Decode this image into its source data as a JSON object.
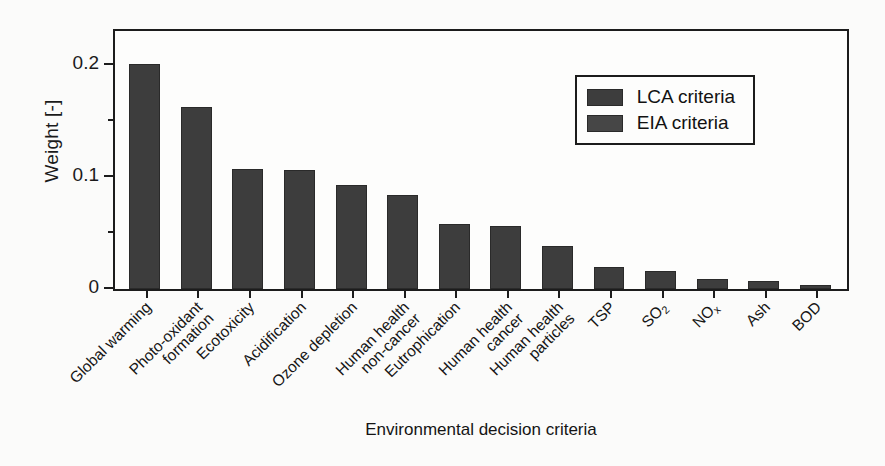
{
  "chart_data": {
    "type": "bar",
    "title": "",
    "xlabel": "Environmental decision criteria",
    "ylabel": "Weight [-]",
    "ylim": [
      0,
      0.23
    ],
    "yticks": [
      "0",
      "0.1",
      "0.2"
    ],
    "ytick_values": [
      0,
      0.1,
      0.2
    ],
    "yminor_values": [
      0.05,
      0.15
    ],
    "grid": false,
    "legend_position": "top-right",
    "categories": [
      "Global warming",
      "Photo-oxidant formation",
      "Ecotoxicity",
      "Acidification",
      "Ozone depletion",
      "Human health non-cancer",
      "Eutrophication",
      "Human health cancer",
      "Human health particles",
      "TSP",
      "SO2",
      "NOx",
      "Ash",
      "BOD"
    ],
    "categories_display": [
      [
        "Global warming"
      ],
      [
        "Photo-oxidant",
        "formation"
      ],
      [
        "Ecotoxicity"
      ],
      [
        "Acidification"
      ],
      [
        "Ozone depletion"
      ],
      [
        "Human health",
        "non-cancer"
      ],
      [
        "Eutrophication"
      ],
      [
        "Human health",
        "cancer"
      ],
      [
        "Human health",
        "particles"
      ],
      [
        "TSP"
      ],
      [
        "SO2"
      ],
      [
        "NOx"
      ],
      [
        "Ash"
      ],
      [
        "BOD"
      ]
    ],
    "series": [
      {
        "name": "LCA criteria",
        "values": [
          0.201,
          0.162,
          0.107,
          0.106,
          0.093,
          0.084,
          0.058,
          0.056,
          0.038,
          0.02,
          0.016,
          0.009,
          0.007,
          0.004
        ]
      }
    ],
    "values": [
      0.201,
      0.162,
      0.107,
      0.106,
      0.093,
      0.084,
      0.058,
      0.056,
      0.038,
      0.02,
      0.016,
      0.009,
      0.007,
      0.004
    ],
    "bar_color": "#3d3d3d"
  },
  "legend": {
    "entries": [
      {
        "label": "LCA criteria",
        "color": "#3d3d3d"
      },
      {
        "label": "EIA criteria",
        "color": "#464646"
      }
    ]
  }
}
